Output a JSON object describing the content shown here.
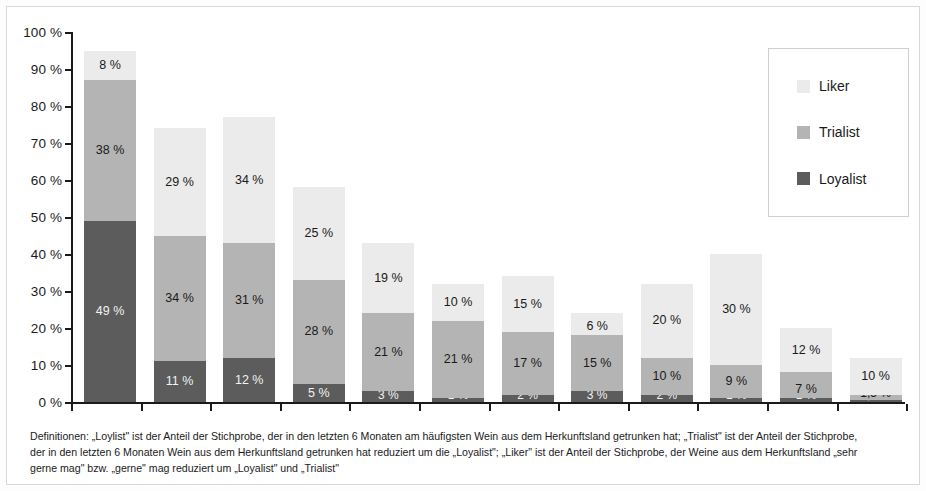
{
  "chart_data": {
    "type": "bar",
    "subtype": "stacked-column",
    "title": "",
    "xlabel": "",
    "ylabel": "",
    "ylim": [
      0,
      100
    ],
    "grid": false,
    "stacked": true,
    "unit": "%",
    "legend_position": "top-right",
    "legend": [
      "Liker",
      "Trialist",
      "Loyalist"
    ],
    "ytick_labels": [
      "100 %",
      "90 %",
      "80 %",
      "70 %",
      "60 %",
      "50 %",
      "40 %",
      "30 %",
      "20 %",
      "10 %",
      "0 %"
    ],
    "ytick_values": [
      100,
      90,
      80,
      70,
      60,
      50,
      40,
      30,
      20,
      10,
      0
    ],
    "categories": [
      "1",
      "2",
      "3",
      "4",
      "5",
      "6",
      "7",
      "8",
      "9",
      "10",
      "11",
      "12"
    ],
    "series": [
      {
        "name": "Loyalist",
        "color": "#5c5c5c",
        "values": [
          49,
          11,
          12,
          5,
          3,
          1,
          2,
          3,
          2,
          1,
          1,
          0.5
        ],
        "labels": [
          "49 %",
          "11 %",
          "12 %",
          "5 %",
          "3 %",
          "1 %",
          "2 %",
          "3 %",
          "2 %",
          "1 %",
          "1 %",
          "0,5 %"
        ]
      },
      {
        "name": "Trialist",
        "color": "#b4b4b4",
        "values": [
          38,
          34,
          31,
          28,
          21,
          21,
          17,
          15,
          10,
          9,
          7,
          1.5
        ],
        "labels": [
          "38 %",
          "34 %",
          "31 %",
          "28 %",
          "21 %",
          "21 %",
          "17 %",
          "15 %",
          "10 %",
          "9 %",
          "7 %",
          "1,5 %"
        ]
      },
      {
        "name": "Liker",
        "color": "#ebebeb",
        "values": [
          8,
          29,
          34,
          25,
          19,
          10,
          15,
          6,
          20,
          30,
          12,
          10
        ],
        "labels": [
          "8 %",
          "29 %",
          "34 %",
          "25 %",
          "19 %",
          "10 %",
          "15 %",
          "6 %",
          "20 %",
          "30 %",
          "12 %",
          "10 %"
        ]
      }
    ],
    "totals": [
      95,
      74,
      77,
      58,
      43,
      32,
      34,
      24,
      32,
      40,
      20,
      12
    ]
  },
  "footnote": {
    "line1": "Definitionen: „Loylist\" ist der Anteil der Stichprobe, der in den letzten 6 Monaten am häufigsten Wein aus dem Herkunftsland getrunken hat; „Trialist\" ist der Anteil der Stichprobe,",
    "line2": "der in den letzten 6 Monaten Wein aus dem Herkunftsland getrunken hat reduziert um die „Loyalist\"; „Liker\" ist der Anteil der Stichprobe, der Weine aus dem Herkunftsland „sehr",
    "line3": "gerne mag\" bzw. „gerne\" mag reduziert um „Loyalist\" und „Trialist\""
  }
}
